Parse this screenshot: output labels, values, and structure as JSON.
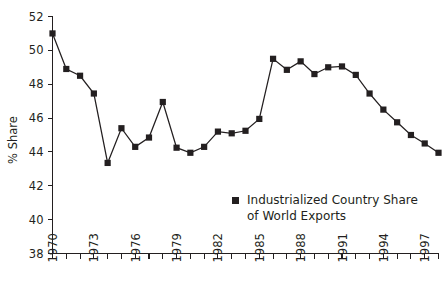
{
  "chart_data": {
    "type": "line",
    "title": "",
    "xlabel": "",
    "ylabel": "% Share",
    "ylim": [
      38,
      52
    ],
    "xlim": [
      1970,
      1998
    ],
    "y_ticks": [
      38,
      40,
      42,
      44,
      46,
      48,
      50,
      52
    ],
    "y_tick_labels": [
      "38",
      "40",
      "42",
      "44",
      "46",
      "48",
      "50",
      "52"
    ],
    "x_ticks": [
      1970,
      1971,
      1972,
      1973,
      1974,
      1975,
      1976,
      1977,
      1978,
      1979,
      1980,
      1981,
      1982,
      1983,
      1984,
      1985,
      1986,
      1987,
      1988,
      1989,
      1990,
      1991,
      1992,
      1993,
      1994,
      1995,
      1996,
      1997,
      1998
    ],
    "x_tick_labels_shown": [
      "1970",
      "1973",
      "1976",
      "1979",
      "1982",
      "1985",
      "1988",
      "1991",
      "1994",
      "1997"
    ],
    "x_label_interval": 3,
    "grid": false,
    "legend_position": "inside-lower-right",
    "marker": "square",
    "series": [
      {
        "name": "Industrialized Country Share of World Exports",
        "legend_line1": "Industrialized Country Share",
        "legend_line2": "of World Exports",
        "color": "#231f20",
        "x": [
          1970,
          1971,
          1972,
          1973,
          1974,
          1975,
          1976,
          1977,
          1978,
          1979,
          1980,
          1981,
          1982,
          1983,
          1984,
          1985,
          1986,
          1987,
          1988,
          1989,
          1990,
          1991,
          1992,
          1993,
          1994,
          1995,
          1996,
          1997,
          1998
        ],
        "values": [
          51.0,
          48.9,
          48.5,
          47.45,
          43.35,
          45.4,
          44.3,
          44.85,
          46.95,
          44.25,
          43.95,
          44.3,
          45.2,
          45.1,
          45.25,
          45.95,
          49.5,
          48.85,
          49.35,
          48.6,
          49.0,
          49.05,
          48.55,
          47.45,
          46.5,
          45.75,
          45.0,
          44.5,
          43.95
        ]
      }
    ]
  },
  "legend": {
    "marker_name": "square-marker",
    "line1": "Industrialized Country Share",
    "line2": "of World Exports"
  },
  "axes": {
    "y_title": "% Share"
  }
}
